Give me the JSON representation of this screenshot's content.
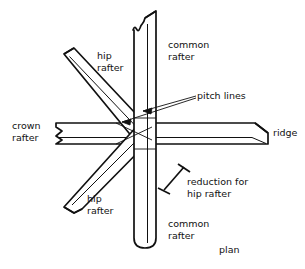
{
  "figure": {
    "title": "plan",
    "view_label": "plan",
    "stroke_color": "#111111",
    "fill_color": "#ffffff",
    "background": "#ffffff",
    "width": 305,
    "height": 269
  },
  "labels": {
    "common_rafter_top": "common\nrafter",
    "common_rafter_bottom": "common\nrafter",
    "hip_rafter_top": "hip\nrafter",
    "hip_rafter_bottom": "hip\nrafter",
    "crown_rafter": "crown\nrafter",
    "ridge": "ridge",
    "pitch_lines": "pitch lines",
    "reduction": "reduction for\nhip rafter",
    "plan": "plan"
  },
  "members": [
    {
      "name": "common-rafter",
      "orientation": "vertical",
      "description": "vertical timber band running top to bottom, broken ends"
    },
    {
      "name": "crown-rafter-ridge",
      "orientation": "horizontal",
      "description": "horizontal timber band, crown rafter at left, ridge at right"
    },
    {
      "name": "hip-rafter-upper-left",
      "orientation": "diagonal-45-up-left",
      "description": "diagonal hip rafter running to upper left"
    },
    {
      "name": "hip-rafter-lower-left",
      "orientation": "diagonal-45-down-left",
      "description": "diagonal hip rafter running to lower left"
    }
  ],
  "annotations": {
    "pitch_lines_leader_count": 2,
    "reduction_marker": "double-ended dimension with crossed tick terminators"
  }
}
